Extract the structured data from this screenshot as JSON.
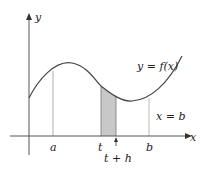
{
  "diagram": {
    "axes": {
      "x_label": "x",
      "y_label": "y"
    },
    "curve_label": "y = f(x)",
    "boundary_label": "x = b",
    "ticks": {
      "a": "a",
      "t": "t",
      "t_plus_h": "t + h",
      "b": "b"
    },
    "colors": {
      "curve": "#444444",
      "shade": "#c8c8c8",
      "axis": "#555555",
      "guide": "#999999"
    }
  }
}
